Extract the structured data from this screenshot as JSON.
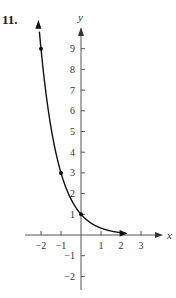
{
  "problem_number": "11.",
  "chart_data": {
    "type": "line",
    "title": "",
    "xlabel": "x",
    "ylabel": "y",
    "function": "y = (1/3)^x",
    "x_ticks": [
      -2,
      -1,
      1,
      2,
      3
    ],
    "y_ticks": [
      -2,
      -1,
      1,
      2,
      3,
      4,
      5,
      6,
      7,
      8,
      9
    ],
    "x_tick_labels": [
      "−2",
      "−1",
      "1",
      "2",
      "3"
    ],
    "y_tick_labels": [
      "−2",
      "−1",
      "1",
      "2",
      "3",
      "4",
      "5",
      "6",
      "7",
      "8",
      "9"
    ],
    "xlim": [
      -2.7,
      3.8
    ],
    "ylim": [
      -2.5,
      10
    ],
    "marked_points": [
      {
        "x": -2,
        "y": 9
      },
      {
        "x": -1,
        "y": 3
      },
      {
        "x": 0,
        "y": 1
      }
    ],
    "series": [
      {
        "name": "curve",
        "x": [
          -2.1,
          -2,
          -1.5,
          -1,
          -0.5,
          0,
          0.5,
          1,
          1.5,
          2,
          2.3
        ],
        "values": [
          10.05,
          9,
          5.2,
          3,
          1.73,
          1,
          0.58,
          0.33,
          0.19,
          0.11,
          0.08
        ]
      }
    ],
    "grid": false,
    "legend": null
  }
}
